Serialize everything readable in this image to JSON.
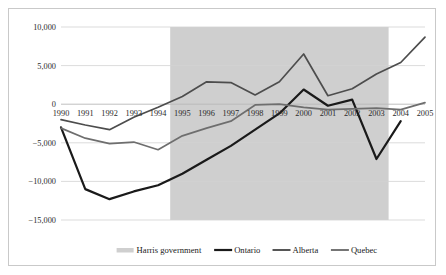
{
  "chart_data": {
    "type": "line",
    "title": "",
    "subtitle": "",
    "xlabel": "",
    "ylabel": "",
    "x": [
      1990,
      1991,
      1992,
      1993,
      1994,
      1995,
      1996,
      1997,
      1998,
      1999,
      2000,
      2001,
      2002,
      2003,
      2004,
      2005
    ],
    "xtick_labels": [
      "1990",
      "1991",
      "1992",
      "1993",
      "1994",
      "1995",
      "1996",
      "1997",
      "1998",
      "1999",
      "2000",
      "2001",
      "2002",
      "2003",
      "2004",
      "2005"
    ],
    "ylim": [
      -15000,
      10000
    ],
    "ytick_values": [
      10000,
      5000,
      0,
      -5000,
      -10000,
      -15000
    ],
    "ytick_labels": [
      "10,000",
      "5,000",
      "0",
      "−5,000",
      "−10,000",
      "−15,000"
    ],
    "grid": true,
    "legend_position": "bottom",
    "series": [
      {
        "name": "Ontario",
        "color": "#1a1a1a",
        "width": 2.2,
        "values": [
          -3000,
          -11000,
          -12300,
          -11300,
          -10500,
          -9000,
          -7200,
          -5400,
          -3300,
          -1200,
          1900,
          -200,
          600,
          -7100,
          -2200,
          null
        ]
      },
      {
        "name": "Alberta",
        "color": "#4d4d4d",
        "width": 1.7,
        "values": [
          -2000,
          -2700,
          -3300,
          -1700,
          -400,
          1000,
          2900,
          2800,
          1200,
          2900,
          6500,
          1100,
          2000,
          3900,
          5400,
          8700
        ]
      },
      {
        "name": "Quebec",
        "color": "#6e6e6e",
        "width": 1.7,
        "values": [
          -3100,
          -4400,
          -5100,
          -4900,
          -5900,
          -4100,
          -3100,
          -2200,
          -100,
          0,
          -400,
          -700,
          -600,
          -500,
          -700,
          200
        ]
      }
    ],
    "shaded_region": {
      "label": "Harris government",
      "color": "#cfcfcf",
      "start": 1994.5,
      "end": 2003.5
    },
    "legend": [
      {
        "label": "Harris government",
        "color": "#cfcfcf",
        "style": "swatch"
      },
      {
        "label": "Ontario",
        "color": "#1a1a1a",
        "style": "line"
      },
      {
        "label": "Alberta",
        "color": "#4d4d4d",
        "style": "line"
      },
      {
        "label": "Quebec",
        "color": "#6e6e6e",
        "style": "line"
      }
    ]
  },
  "colors": {
    "frame_border": "#c9c9c9",
    "gridline": "#d2d2d2",
    "background": "#ffffff",
    "shading": "#cfcfcf",
    "text": "#2b2b2b"
  }
}
